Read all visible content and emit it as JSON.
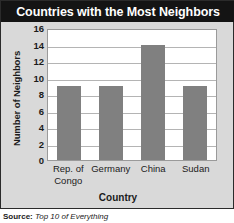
{
  "chart_data": {
    "type": "bar",
    "title": "Countries with the Most Neighbors",
    "categories": [
      "Rep. of Congo",
      "Germany",
      "China",
      "Sudan"
    ],
    "category_lines": [
      [
        "Rep. of",
        "Congo"
      ],
      [
        "Germany"
      ],
      [
        "China"
      ],
      [
        "Sudan"
      ]
    ],
    "values": [
      9,
      9,
      14,
      9
    ],
    "xlabel": "Country",
    "ylabel": "Number of Neighbors",
    "ylim": [
      0,
      16
    ],
    "ytick_step": 2,
    "yticks": [
      16,
      14,
      12,
      10,
      8,
      6,
      4,
      2,
      0
    ],
    "grid": true,
    "legend": false,
    "bar_color": "#808080",
    "plot_background": "#ffffff",
    "figure_background": "#d9d9d9",
    "title_banner_color": "#141414",
    "title_text_color": "#ffffff"
  },
  "source": {
    "label": "Source:",
    "value": "Top 10 of Everything"
  }
}
